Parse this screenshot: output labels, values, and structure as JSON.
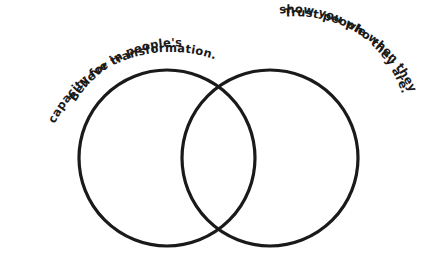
{
  "diagram": {
    "type": "venn",
    "stroke_color": "#1a1a1a",
    "background": "#ffffff",
    "left_circle": {
      "label_lines": [
        "Believe in people's",
        "capacity for transformation."
      ]
    },
    "right_circle": {
      "label_lines": [
        "Trust people when they",
        "show you who they are."
      ]
    }
  }
}
